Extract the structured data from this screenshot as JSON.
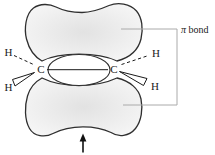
{
  "figure": {
    "background_color": "#ffffff",
    "outline_color": "#2f2f2f",
    "lobe_fill_center": "#e2e2e2",
    "lobe_fill_edge": "#f8f8f8",
    "leader_line_color": "#aaaaaa",
    "text_color": "#1a1a1a"
  },
  "labels": {
    "pi_symbol": "π",
    "bond_word": " bond",
    "carbon_left": "C",
    "carbon_right": "C",
    "hydrogen_top_left": "H",
    "hydrogen_bottom_left": "H",
    "hydrogen_top_right": "H",
    "hydrogen_bottom_right": "H"
  },
  "icons": {
    "up_arrow": "upward-pointing arrow indicating bottom pi lobe"
  }
}
